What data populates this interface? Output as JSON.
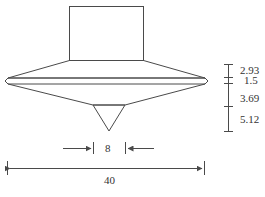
{
  "diagram": {
    "type": "engineering-drawing",
    "colors": {
      "line": "#4a4a4a",
      "text": "#333333",
      "background": "#ffffff"
    },
    "vertical_dimensions": [
      {
        "id": "upper-taper-height",
        "label": "2.93"
      },
      {
        "id": "rim-band-height",
        "label": "1.5"
      },
      {
        "id": "lower-cone-height",
        "label": "3.69"
      },
      {
        "id": "tip-height",
        "label": "5.12"
      }
    ],
    "horizontal_dimensions": {
      "tip_base_width": {
        "label": "8"
      },
      "overall_width": {
        "label": "40"
      }
    }
  }
}
